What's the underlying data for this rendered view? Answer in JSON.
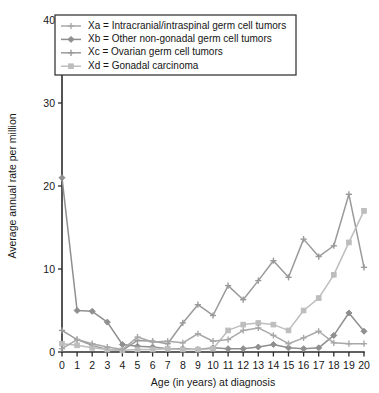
{
  "figure": {
    "background": "#ffffff",
    "plot_area": {
      "left": 62,
      "right": 364,
      "top": 20,
      "bottom": 352
    }
  },
  "legend": {
    "position": "top-left",
    "border_color": "#3a3a3a",
    "entries": [
      {
        "key": "Xa",
        "label": "Xa = Intracranial/intraspinal germ cell tumors",
        "color": "#a8a8a8",
        "marker": "plus-marker"
      },
      {
        "key": "Xb",
        "label": "Xb = Other non-gonadal germ cell tumors",
        "color": "#8f8f8f",
        "marker": "diamond-marker"
      },
      {
        "key": "Xc",
        "label": "Xc = Ovarian germ cell tumors",
        "color": "#9a9a9a",
        "marker": "plus-marker"
      },
      {
        "key": "Xd",
        "label": "Xd = Gonadal carcinoma",
        "color": "#bdbdbd",
        "marker": "square-marker"
      }
    ]
  },
  "chart_data": {
    "type": "line",
    "title": "",
    "xlabel": "Age (in years) at diagnosis",
    "ylabel": "Average annual rate per million",
    "xlim": [
      0,
      20
    ],
    "ylim": [
      0,
      40
    ],
    "xticks": [
      0,
      1,
      2,
      3,
      4,
      5,
      6,
      7,
      8,
      9,
      10,
      11,
      12,
      13,
      14,
      15,
      16,
      17,
      18,
      19,
      20
    ],
    "yticks": [
      0,
      10,
      20,
      30,
      40
    ],
    "xtick_labels": [
      "0",
      "1",
      "2",
      "3",
      "4",
      "5",
      "6",
      "7",
      "8",
      "9",
      "10",
      "11",
      "12",
      "13",
      "14",
      "15",
      "16",
      "17",
      "18",
      "19",
      "20"
    ],
    "ytick_labels": [
      "0",
      "10",
      "20",
      "30",
      "40"
    ],
    "grid": false,
    "legend_position": "upper left",
    "x": [
      0,
      1,
      2,
      3,
      4,
      5,
      6,
      7,
      8,
      9,
      10,
      11,
      12,
      13,
      14,
      15,
      16,
      17,
      18,
      19,
      20
    ],
    "series": [
      {
        "name": "Xa = Intracranial/intraspinal germ cell tumors",
        "key": "Xa",
        "color": "#a8a8a8",
        "marker": "plus-marker",
        "values": [
          0.4,
          0.5,
          0.3,
          0.3,
          0.2,
          0.4,
          0.6,
          0.6,
          0.5,
          0.5,
          0.6,
          0.5,
          0.4,
          0.6,
          0.7,
          0.8,
          0.9,
          0.9,
          1.0,
          1.0,
          1.0
        ]
      },
      {
        "name": "Xb = Other non-gonadal germ cell tumors",
        "key": "Xb",
        "color": "#8f8f8f",
        "marker": "diamond-marker",
        "values": [
          21.0,
          5.0,
          4.9,
          3.6,
          0.9,
          0.7,
          0.6,
          0.4,
          0.4,
          0.3,
          0.5,
          0.4,
          0.4,
          0.6,
          0.9,
          0.5,
          0.4,
          0.5,
          2.0,
          4.7,
          2.5
        ]
      },
      {
        "name": "Xc = Ovarian germ cell tumors",
        "key": "Xc",
        "color": "#9a9a9a",
        "marker": "plus-marker",
        "values": [
          2.6,
          1.5,
          0.8,
          0.3,
          0.2,
          1.4,
          1.3,
          1.0,
          3.5,
          5.7,
          4.4,
          6.0,
          3.5,
          6.3,
          6.1,
          3.1,
          2.8,
          2.1,
          1.9,
          1.6,
          1.3
        ]
      },
      {
        "name": "Xd = Gonadal carcinoma",
        "key": "Xd",
        "color": "#bdbdbd",
        "marker": "square-marker",
        "values": [
          1.0,
          0.8,
          0.5,
          0.3,
          0.2,
          0.3,
          0.3,
          0.4,
          0.3,
          0.3,
          0.4,
          0.4,
          0.5,
          1.9,
          2.9,
          2.6,
          2.5,
          2.6,
          2.3,
          2.2,
          2.1
        ]
      },
      {
        "name": "Xc rising branch",
        "key": "Xc2",
        "color": "#9a9a9a",
        "marker": "plus-marker",
        "values": [
          null,
          null,
          null,
          null,
          null,
          null,
          null,
          null,
          null,
          null,
          null,
          null,
          null,
          null,
          null,
          null,
          null,
          null,
          null,
          null,
          null
        ]
      }
    ],
    "series_rendered": [
      {
        "key": "Xb",
        "color": "#8f8f8f",
        "marker": "diamond-marker",
        "points": [
          [
            0,
            21.0
          ],
          [
            1,
            5.0
          ],
          [
            2,
            4.9
          ],
          [
            3,
            3.6
          ],
          [
            4,
            0.9
          ],
          [
            5,
            0.7
          ],
          [
            6,
            0.6
          ],
          [
            7,
            0.4
          ],
          [
            8,
            0.4
          ],
          [
            9,
            0.3
          ],
          [
            10,
            0.5
          ],
          [
            11,
            0.4
          ],
          [
            12,
            0.4
          ],
          [
            13,
            0.6
          ],
          [
            14,
            0.9
          ],
          [
            15,
            0.5
          ],
          [
            16,
            0.4
          ],
          [
            17,
            0.5
          ],
          [
            18,
            2.0
          ],
          [
            19,
            4.7
          ],
          [
            20,
            2.5
          ]
        ]
      },
      {
        "key": "Xc",
        "color": "#9a9a9a",
        "marker": "plus-marker",
        "points": [
          [
            0,
            2.6
          ],
          [
            1,
            1.5
          ],
          [
            2,
            0.8
          ],
          [
            3,
            0.3
          ],
          [
            4,
            0.2
          ],
          [
            5,
            1.4
          ],
          [
            6,
            1.3
          ],
          [
            7,
            1.0
          ],
          [
            8,
            3.5
          ],
          [
            9,
            5.7
          ],
          [
            10,
            4.4
          ],
          [
            11,
            8.0
          ],
          [
            12,
            6.3
          ],
          [
            13,
            8.6
          ],
          [
            14,
            11.0
          ],
          [
            15,
            9.0
          ],
          [
            16,
            13.6
          ],
          [
            17,
            11.5
          ],
          [
            18,
            12.8
          ],
          [
            19,
            19.0
          ],
          [
            20,
            10.2
          ]
        ]
      },
      {
        "key": "Xd",
        "color": "#bdbdbd",
        "marker": "square-marker",
        "points": [
          [
            0,
            1.0
          ],
          [
            1,
            0.8
          ],
          [
            2,
            0.5
          ],
          [
            3,
            0.3
          ],
          [
            4,
            0.2
          ],
          [
            5,
            0.3
          ],
          [
            6,
            0.3
          ],
          [
            7,
            0.4
          ],
          [
            8,
            0.3
          ],
          [
            9,
            0.3
          ],
          [
            10,
            0.4
          ],
          [
            11,
            2.6
          ],
          [
            12,
            3.3
          ],
          [
            13,
            3.5
          ],
          [
            14,
            3.3
          ],
          [
            15,
            2.6
          ],
          [
            16,
            5.0
          ],
          [
            17,
            6.5
          ],
          [
            18,
            9.3
          ],
          [
            19,
            13.2
          ],
          [
            20,
            17.0
          ]
        ]
      },
      {
        "key": "Xa",
        "color": "#a8a8a8",
        "marker": "plus-marker",
        "points": [
          [
            0,
            0.4
          ],
          [
            1,
            1.5
          ],
          [
            2,
            1.0
          ],
          [
            3,
            0.6
          ],
          [
            4,
            0.3
          ],
          [
            5,
            1.8
          ],
          [
            6,
            1.2
          ],
          [
            7,
            1.3
          ],
          [
            8,
            1.1
          ],
          [
            9,
            2.2
          ],
          [
            10,
            1.3
          ],
          [
            11,
            1.5
          ],
          [
            12,
            2.6
          ],
          [
            13,
            2.9
          ],
          [
            14,
            2.0
          ],
          [
            15,
            1.0
          ],
          [
            16,
            1.7
          ],
          [
            17,
            2.5
          ],
          [
            18,
            1.1
          ],
          [
            19,
            1.0
          ],
          [
            20,
            1.0
          ]
        ]
      }
    ]
  }
}
